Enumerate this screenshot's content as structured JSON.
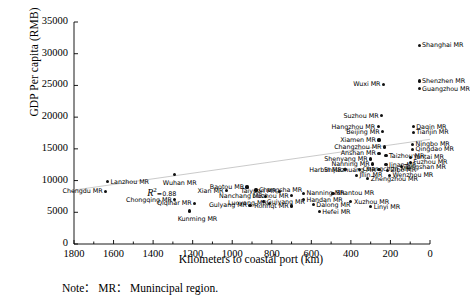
{
  "chart_data": {
    "type": "scatter",
    "title": "",
    "xlabel": "Kilometers to coastal port (km)",
    "ylabel": "GDP Per capita (RMB)",
    "xlim": [
      1800,
      0
    ],
    "ylim": [
      0,
      35000
    ],
    "x_reversed": true,
    "xticks": [
      1800,
      1600,
      1400,
      1200,
      1000,
      800,
      600,
      400,
      200,
      0
    ],
    "yticks": [
      0,
      5000,
      10000,
      15000,
      20000,
      25000,
      30000,
      35000
    ],
    "grid": false,
    "legend": null,
    "annotations": [
      {
        "name": "r-squared",
        "text": "R",
        "sup": "2",
        "value": "=0.88",
        "x": 1430,
        "y": 8000
      }
    ],
    "note": "Note： MR： Munincipal region.",
    "trendline": {
      "visible": true,
      "x0": 1800,
      "y0": 8500,
      "x1": 0,
      "y1": 16500
    },
    "points": [
      {
        "label": "Shanghai MR",
        "x": 55,
        "y": 31300,
        "lab_side": "right"
      },
      {
        "label": "Shenzhen MR",
        "x": 55,
        "y": 25700,
        "lab_side": "right"
      },
      {
        "label": "Guangzhou MR",
        "x": 55,
        "y": 24500,
        "lab_side": "right"
      },
      {
        "label": "Wuxi MR",
        "x": 235,
        "y": 25200,
        "lab_side": "left"
      },
      {
        "label": "Suzhou MR",
        "x": 245,
        "y": 20200,
        "lab_side": "left"
      },
      {
        "label": "Hangzhou MR",
        "x": 262,
        "y": 18500,
        "lab_side": "left"
      },
      {
        "label": "Beijing MR",
        "x": 240,
        "y": 17700,
        "lab_side": "left"
      },
      {
        "label": "Daqin MR",
        "x": 85,
        "y": 18500,
        "lab_side": "right"
      },
      {
        "label": "Tianjin MR",
        "x": 85,
        "y": 17600,
        "lab_side": "right"
      },
      {
        "label": "Xiamen MR",
        "x": 258,
        "y": 16400,
        "lab_side": "left"
      },
      {
        "label": "Ningbo MR",
        "x": 88,
        "y": 15700,
        "lab_side": "right"
      },
      {
        "label": "Qingdao MR",
        "x": 88,
        "y": 14900,
        "lab_side": "right"
      },
      {
        "label": "Changzhou MR",
        "x": 230,
        "y": 15300,
        "lab_side": "left"
      },
      {
        "label": "Anshan MR",
        "x": 258,
        "y": 14300,
        "lab_side": "left"
      },
      {
        "label": "Taizhou MR",
        "x": 222,
        "y": 13900,
        "lab_side": "right"
      },
      {
        "label": "Yantai MR",
        "x": 100,
        "y": 13700,
        "lab_side": "right"
      },
      {
        "label": "Fuzhou MR",
        "x": 100,
        "y": 12900,
        "lab_side": "right"
      },
      {
        "label": "Shenyang MR",
        "x": 300,
        "y": 13400,
        "lab_side": "left"
      },
      {
        "label": "Nanning MR",
        "x": 290,
        "y": 12600,
        "lab_side": "left"
      },
      {
        "label": "Jinan MR",
        "x": 222,
        "y": 12500,
        "lab_side": "right"
      },
      {
        "label": "Tangshan MR",
        "x": 145,
        "y": 12200,
        "lab_side": "right"
      },
      {
        "label": "Shijiazhuang MR",
        "x": 258,
        "y": 11700,
        "lab_side": "left"
      },
      {
        "label": "Zibo MR",
        "x": 215,
        "y": 11600,
        "lab_side": "right"
      },
      {
        "label": "Wenzhou MR",
        "x": 205,
        "y": 10800,
        "lab_side": "right"
      },
      {
        "label": "Harbin MR",
        "x": 430,
        "y": 11700,
        "lab_side": "left"
      },
      {
        "label": "Changchun MR",
        "x": 355,
        "y": 11800,
        "lab_side": "right"
      },
      {
        "label": "Jilin MR",
        "x": 372,
        "y": 10800,
        "lab_side": "right"
      },
      {
        "label": "Zhengzhou MR",
        "x": 315,
        "y": 10300,
        "lab_side": "right"
      },
      {
        "label": "Wuhan MR",
        "x": 1290,
        "y": 10900,
        "lab_side": "below"
      },
      {
        "label": "Lanzhou MR",
        "x": 1630,
        "y": 9800,
        "lab_side": "right"
      },
      {
        "label": "Chengdu MR",
        "x": 1640,
        "y": 8300,
        "lab_side": "left"
      },
      {
        "label": "Chongqing MR",
        "x": 1290,
        "y": 7000,
        "lab_side": "left"
      },
      {
        "label": "Qiqihar MR",
        "x": 1190,
        "y": 6400,
        "lab_side": "left"
      },
      {
        "label": "Kunming MR",
        "x": 1215,
        "y": 5200,
        "lab_side": "below"
      },
      {
        "label": "Xian MR",
        "x": 1030,
        "y": 8400,
        "lab_side": "left"
      },
      {
        "label": "Baotou MR",
        "x": 925,
        "y": 9000,
        "lab_side": "left"
      },
      {
        "label": "Changsha MR",
        "x": 880,
        "y": 8500,
        "lab_side": "right"
      },
      {
        "label": "Nanchang MR",
        "x": 830,
        "y": 7500,
        "lab_side": "left"
      },
      {
        "label": "Guiyang MR",
        "x": 840,
        "y": 6700,
        "lab_side": "right"
      },
      {
        "label": "Gulyang MR",
        "x": 910,
        "y": 6100,
        "lab_side": "left"
      },
      {
        "label": "Taiyuan MR",
        "x": 760,
        "y": 8300,
        "lab_side": "left"
      },
      {
        "label": "Liuzhou MR",
        "x": 700,
        "y": 7600,
        "lab_side": "left"
      },
      {
        "label": "Luoyang MR",
        "x": 810,
        "y": 6400,
        "lab_side": "left"
      },
      {
        "label": "Ronhqt MR",
        "x": 700,
        "y": 6000,
        "lab_side": "left"
      },
      {
        "label": "Nanning MR",
        "x": 640,
        "y": 8000,
        "lab_side": "right"
      },
      {
        "label": "Handan MR",
        "x": 640,
        "y": 7000,
        "lab_side": "right"
      },
      {
        "label": "Dalong MR",
        "x": 590,
        "y": 6200,
        "lab_side": "right"
      },
      {
        "label": "Hefei MR",
        "x": 560,
        "y": 5100,
        "lab_side": "right"
      },
      {
        "label": "Shantou MR",
        "x": 490,
        "y": 8000,
        "lab_side": "right"
      },
      {
        "label": "Xuzhou MR",
        "x": 400,
        "y": 6700,
        "lab_side": "right"
      },
      {
        "label": "Linyi MR",
        "x": 300,
        "y": 5900,
        "lab_side": "right"
      }
    ]
  }
}
